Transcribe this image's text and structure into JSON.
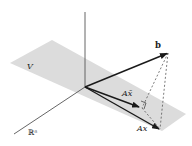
{
  "figure": {
    "labels": {
      "plane": "V",
      "space": "ℝⁿ",
      "vector_b": "b",
      "projection": "Ax̄",
      "arbitrary": "Ax"
    },
    "colors": {
      "plane": "#dcdcdc",
      "vector": "#1a1a1a",
      "axis": "#555555",
      "dashed": "#444444"
    }
  }
}
